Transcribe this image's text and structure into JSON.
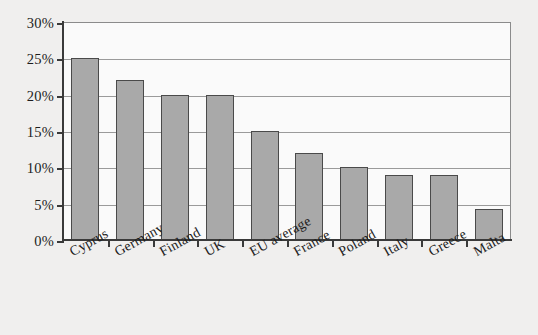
{
  "chart_data": {
    "type": "bar",
    "title": "",
    "subtitle": "",
    "xlabel": "",
    "ylabel": "",
    "categories": [
      "Cyprus",
      "Germany",
      "Finland",
      "UK",
      "EU average",
      "France",
      "Poland",
      "Italy",
      "Greece",
      "Malta"
    ],
    "values": [
      25,
      22,
      20,
      20,
      15,
      12,
      10,
      9,
      9,
      4.3
    ],
    "value_suffix": "%",
    "ylim": [
      0,
      30
    ],
    "ytick_values": [
      0,
      5,
      10,
      15,
      20,
      25,
      30
    ],
    "ytick_labels": [
      "0%",
      "5%",
      "10%",
      "15%",
      "20%",
      "25%",
      "30%"
    ],
    "grid": true,
    "grid_axis": "y",
    "legend": false,
    "legend_position": "none",
    "series": [
      {
        "name": "",
        "values": [
          25,
          22,
          20,
          20,
          15,
          12,
          10,
          9,
          9,
          4.3
        ]
      }
    ],
    "annotations": [],
    "colors": {
      "bar_fill": "#a9a9a9",
      "bar_edge": "#4a4a4a",
      "axis": "#3a3a3a",
      "gridline": "#9a9a9a",
      "plot_background": "#fafafa",
      "page_background": "#f0efee",
      "text": "#1d1d1d"
    }
  }
}
